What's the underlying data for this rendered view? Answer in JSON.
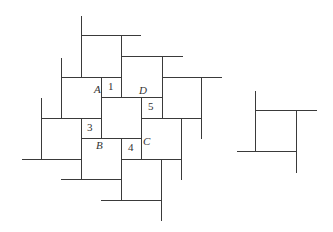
{
  "diagram": {
    "title": "",
    "main_figure": {
      "description": "Pinwheel tiling of squares around a central square ABCD",
      "vertex_labels": [
        {
          "id": "A",
          "text": "A",
          "x": 94,
          "y": 93
        },
        {
          "id": "B",
          "text": "B",
          "x": 96,
          "y": 149
        },
        {
          "id": "C",
          "text": "C",
          "x": 143,
          "y": 145
        },
        {
          "id": "D",
          "text": "D",
          "x": 139,
          "y": 94
        }
      ],
      "region_labels": [
        {
          "id": "1",
          "text": "1",
          "x": 108,
          "y": 90
        },
        {
          "id": "3",
          "text": "3",
          "x": 87,
          "y": 131
        },
        {
          "id": "4",
          "text": "4",
          "x": 128,
          "y": 151
        },
        {
          "id": "5",
          "text": "5",
          "x": 148,
          "y": 110
        }
      ],
      "segments": [
        [
          81,
          15,
          81,
          77
        ],
        [
          81,
          35,
          140,
          35
        ],
        [
          121,
          35,
          121,
          97
        ],
        [
          121,
          56,
          182,
          56
        ],
        [
          162,
          56,
          162,
          118
        ],
        [
          61,
          77,
          121,
          77
        ],
        [
          162,
          77,
          221,
          77
        ],
        [
          61,
          57,
          61,
          118
        ],
        [
          201,
          77,
          201,
          138
        ],
        [
          101,
          97,
          162,
          97
        ],
        [
          101,
          77,
          101,
          138
        ],
        [
          141,
          97,
          141,
          159
        ],
        [
          41,
          97,
          41,
          159
        ],
        [
          41,
          118,
          101,
          118
        ],
        [
          81,
          118,
          81,
          179
        ],
        [
          21,
          159,
          81,
          159
        ],
        [
          60,
          179,
          121,
          179
        ],
        [
          81,
          138,
          141,
          138
        ],
        [
          121,
          138,
          121,
          200
        ],
        [
          100,
          200,
          161,
          200
        ],
        [
          141,
          118,
          201,
          118
        ],
        [
          181,
          118,
          181,
          179
        ],
        [
          121,
          159,
          181,
          159
        ],
        [
          161,
          159,
          161,
          220
        ]
      ]
    },
    "side_figure": {
      "description": "Single square with extended edges",
      "segments": [
        [
          255,
          90,
          255,
          151
        ],
        [
          255,
          110,
          316,
          110
        ],
        [
          296,
          110,
          296,
          172
        ],
        [
          236,
          151,
          296,
          151
        ]
      ]
    }
  }
}
